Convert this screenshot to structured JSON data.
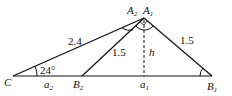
{
  "diagram": {
    "points": {
      "C": {
        "label": "C",
        "x": 13,
        "y": 76
      },
      "B2": {
        "label": "B",
        "sub": "2",
        "x": 82,
        "y": 76
      },
      "B1": {
        "label": "B",
        "sub": "1",
        "x": 212,
        "y": 76
      },
      "A1": {
        "label": "A",
        "sub": "1",
        "x": 144,
        "y": 18
      },
      "A2": {
        "label": "A",
        "sub": "2"
      },
      "foot": {
        "label": "a",
        "sub": "1",
        "x": 144,
        "y": 76
      }
    },
    "segment_labels": {
      "CA": "2.4",
      "B2A": "1.5",
      "B1A": "1.5",
      "height": "h",
      "CB2": "a",
      "CB2_sub": "2"
    },
    "angle_label": "24°",
    "stroke_color": "#111111"
  }
}
